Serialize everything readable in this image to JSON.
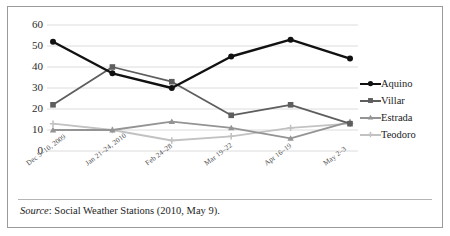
{
  "chart_data": {
    "type": "line",
    "title": "",
    "xlabel": "",
    "ylabel": "",
    "ylim": [
      0,
      60
    ],
    "yticks": [
      0,
      10,
      20,
      30,
      40,
      50,
      60
    ],
    "grid": true,
    "legend_position": "right",
    "categories": [
      "Dec 5–10, 2009",
      "Jan 21–24, 2010",
      "Feb 24–28",
      "Mar 19–22",
      "Apr 16–19",
      "May 2–3"
    ],
    "series": [
      {
        "name": "Aquino",
        "values": [
          52,
          37,
          30,
          45,
          53,
          44
        ],
        "color": "#111111",
        "marker": "circle"
      },
      {
        "name": "Villar",
        "values": [
          22,
          40,
          33,
          17,
          22,
          13
        ],
        "color": "#5e5e5e",
        "marker": "square"
      },
      {
        "name": "Estrada",
        "values": [
          10,
          10,
          14,
          11,
          6,
          14
        ],
        "color": "#949494",
        "marker": "triangle"
      },
      {
        "name": "Teodoro",
        "values": [
          13,
          10,
          5,
          7,
          11,
          13
        ],
        "color": "#c2c2c2",
        "marker": "plus"
      }
    ]
  },
  "legend": {
    "entries": [
      {
        "label": "Aquino"
      },
      {
        "label": "Villar"
      },
      {
        "label": "Estrada"
      },
      {
        "label": "Teodoro"
      }
    ]
  },
  "caption": {
    "source_word": "Source",
    "source_text": ": Social Weather Stations (2010, May 9)."
  }
}
